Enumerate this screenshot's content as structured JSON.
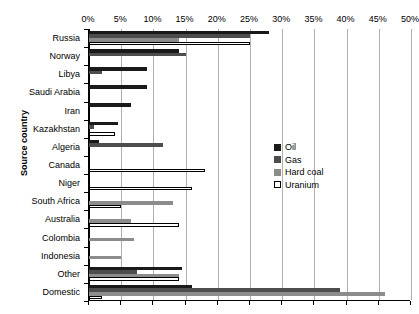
{
  "chart_data": {
    "type": "bar",
    "orientation": "horizontal",
    "title": "",
    "xlabel": "",
    "ylabel": "Source country",
    "xlim": [
      0,
      50
    ],
    "xtick_labels": [
      "0%",
      "5%",
      "10%",
      "15%",
      "20%",
      "25%",
      "30%",
      "35%",
      "40%",
      "45%",
      "50%"
    ],
    "xtick_values": [
      0,
      5,
      10,
      15,
      20,
      25,
      30,
      35,
      40,
      45,
      50
    ],
    "grid": true,
    "legend_position": "center-right",
    "categories": [
      "Russia",
      "Norway",
      "Libya",
      "Saudi Arabia",
      "Iran",
      "Kazakhstan",
      "Algeria",
      "Canada",
      "Niger",
      "South Africa",
      "Australia",
      "Colombia",
      "Indonesia",
      "Other",
      "Domestic"
    ],
    "series": [
      {
        "name": "Oil",
        "color": "#1a1a1a",
        "values": [
          28.0,
          14.0,
          9.0,
          9.0,
          6.5,
          4.5,
          1.5,
          0,
          0,
          0,
          0,
          0,
          0,
          14.5,
          16.0
        ]
      },
      {
        "name": "Gas",
        "color": "#4d4d4d",
        "values": [
          25.0,
          15.0,
          2.0,
          0,
          0,
          0.8,
          11.5,
          0,
          0,
          0,
          0,
          0,
          0,
          7.5,
          39.0
        ]
      },
      {
        "name": "Hard coal",
        "color": "#8c8c8c",
        "values": [
          14.0,
          0,
          0,
          0,
          0,
          0,
          0,
          0,
          0,
          13.0,
          6.5,
          7.0,
          5.0,
          14.0,
          46.0
        ]
      },
      {
        "name": "Uranium",
        "color": "#ffffff",
        "values": [
          25.0,
          0,
          0,
          0,
          0,
          4.0,
          0,
          18.0,
          16.0,
          5.0,
          14.0,
          0,
          0,
          14.0,
          2.0
        ]
      }
    ]
  },
  "legend": {
    "items": [
      {
        "label": "Oil",
        "key": "oil"
      },
      {
        "label": "Gas",
        "key": "gas"
      },
      {
        "label": "Hard coal",
        "key": "coal"
      },
      {
        "label": "Uranium",
        "key": "uranium"
      }
    ]
  },
  "axis": {
    "y_title": "Source country"
  }
}
